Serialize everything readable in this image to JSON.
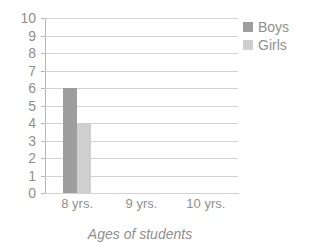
{
  "chart_data": {
    "type": "bar",
    "title": "",
    "subtitle": "",
    "categories": [
      "8 yrs.",
      "9 yrs.",
      "10 yrs."
    ],
    "series": [
      {
        "name": "Boys",
        "color": "#9e9e9e",
        "values": [
          6,
          0,
          0
        ]
      },
      {
        "name": "Girls",
        "color": "#cfcfcf",
        "values": [
          4,
          0,
          0
        ]
      }
    ],
    "xlabel": "Ages of students",
    "ylabel": "",
    "ylim": [
      0,
      10
    ],
    "ytick_step": 1,
    "yticks": [
      "10",
      "9",
      "8",
      "7",
      "6",
      "5",
      "4",
      "3",
      "2",
      "1",
      "0"
    ],
    "grid": "horizontal",
    "legend_position": "top-right"
  },
  "legend": {
    "items": [
      {
        "label": "Boys",
        "color": "#9e9e9e"
      },
      {
        "label": "Girls",
        "color": "#cfcfcf"
      }
    ]
  },
  "axis": {
    "x_title": "Ages of students"
  },
  "colors": {
    "boys": "#9e9e9e",
    "girls": "#cfcfcf",
    "gridline": "#d2d2d2",
    "axis": "#b6b6b6",
    "text": "#8f8f8f",
    "background": "#ffffff"
  }
}
